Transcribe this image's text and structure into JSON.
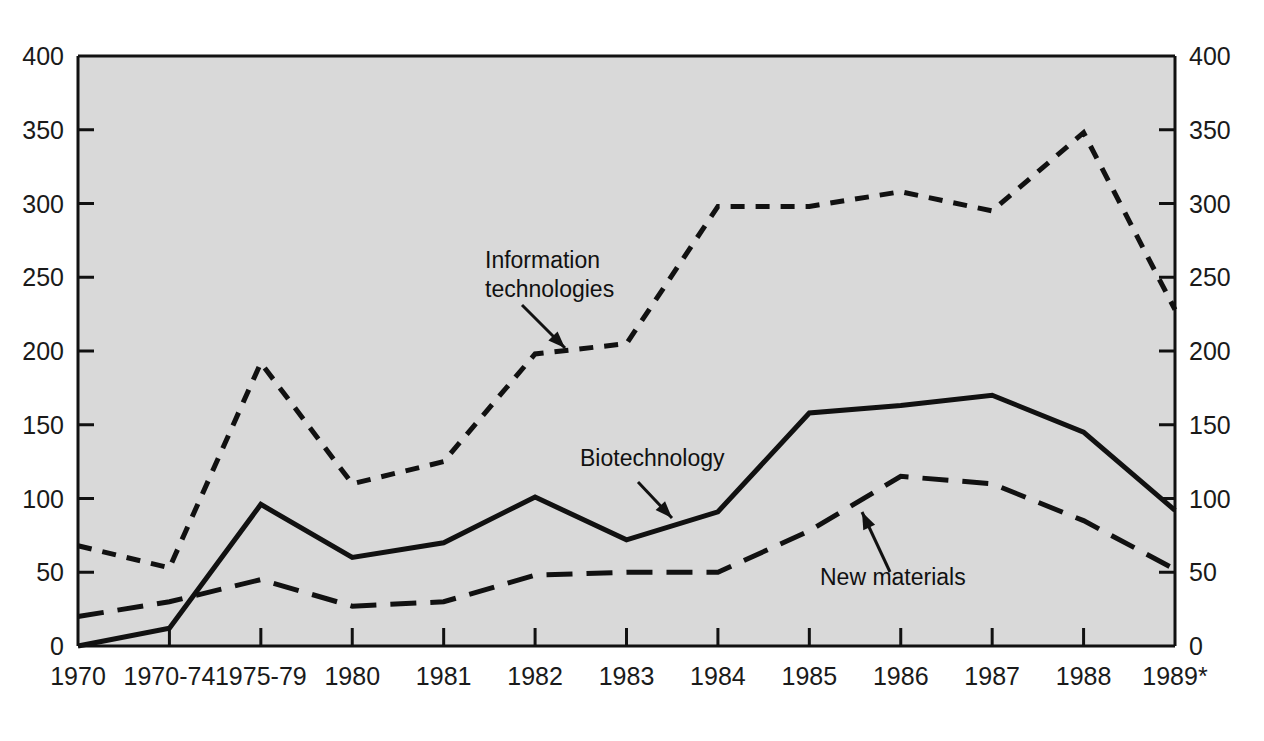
{
  "chart_data": {
    "type": "line",
    "title": "",
    "subtitle": "",
    "xlabel": "",
    "ylabel": "",
    "ylim": [
      0,
      400
    ],
    "yticks": [
      0,
      50,
      100,
      150,
      200,
      250,
      300,
      350,
      400
    ],
    "ytick_labels": [
      "0",
      "50",
      "100",
      "150",
      "200",
      "250",
      "300",
      "350",
      "400"
    ],
    "dual_y_axis": true,
    "grid": false,
    "legend_position": "inline-annotations",
    "plot_background": "#d9d9d9",
    "categories": [
      "1970",
      "1970-74",
      "1975-79",
      "1980",
      "1981",
      "1982",
      "1983",
      "1984",
      "1985",
      "1986",
      "1987",
      "1988",
      "1989*"
    ],
    "series": [
      {
        "name": "Information technologies",
        "style": "dotted",
        "color": "#111111",
        "values": [
          68,
          53,
          192,
          110,
          125,
          198,
          205,
          298,
          298,
          308,
          295,
          348,
          228
        ]
      },
      {
        "name": "Biotechnology",
        "style": "solid",
        "color": "#111111",
        "values": [
          0,
          12,
          96,
          60,
          70,
          101,
          72,
          91,
          158,
          163,
          170,
          145,
          92
        ]
      },
      {
        "name": "New materials",
        "style": "dashed",
        "color": "#111111",
        "values": [
          20,
          30,
          45,
          27,
          30,
          48,
          50,
          50,
          78,
          115,
          110,
          85,
          52
        ]
      }
    ],
    "annotations": [
      {
        "name": "information-technologies",
        "lines": [
          "Information",
          "technologies"
        ],
        "x": 485,
        "y": 268,
        "arrow_from": [
          522,
          305
        ],
        "arrow_to": [
          565,
          348
        ]
      },
      {
        "name": "biotechnology",
        "lines": [
          "Biotechnology"
        ],
        "x": 580,
        "y": 466,
        "arrow_from": [
          638,
          482
        ],
        "arrow_to": [
          672,
          518
        ]
      },
      {
        "name": "new-materials",
        "lines": [
          "New materials"
        ],
        "x": 820,
        "y": 585,
        "arrow_from": [
          890,
          572
        ],
        "arrow_to": [
          862,
          512
        ]
      }
    ]
  },
  "axes": {
    "left_axis_name": "left-y-axis",
    "right_axis_name": "right-y-axis",
    "bottom_axis_name": "x-axis"
  }
}
